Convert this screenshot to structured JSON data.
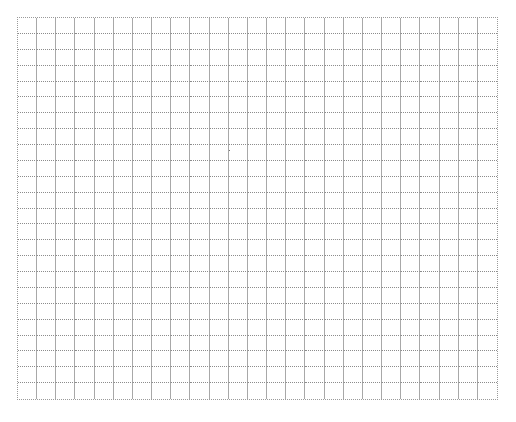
{
  "grid": {
    "columns": 25,
    "rows": 24,
    "left": 17,
    "top": 17,
    "width": 481,
    "height": 383,
    "line_color": "#a8a8a8",
    "dotted_line_color": "#8c8c8c",
    "background": "#ffffff"
  },
  "marks": [
    {
      "x": 229,
      "y": 150,
      "color": "#777777"
    }
  ]
}
